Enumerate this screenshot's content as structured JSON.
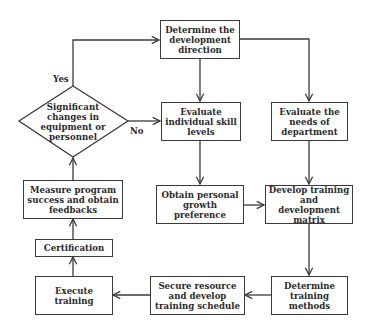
{
  "diagram": {
    "type": "flowchart",
    "colors": {
      "line": "#3a3a3a",
      "text": "#2a2a2a",
      "background": "#ffffff"
    },
    "nodes": {
      "determine_direction": "Determine the development direction",
      "evaluate_skills": "Evaluate individual skill levels",
      "evaluate_needs": "Evaluate the needs of department",
      "obtain_preference": "Obtain personal growth preference",
      "develop_matrix": "Develop training and development matrix",
      "determine_methods": "Determine training methods",
      "secure_resource": "Secure resource and develop training schedule",
      "execute_training": "Execute training",
      "certification": "Certification",
      "measure_success": "Measure program success and obtain feedbacks",
      "decision": "Significant changes in equipment or personnel"
    },
    "labels": {
      "yes": "Yes",
      "no": "No"
    },
    "edges": [
      [
        "determine_direction",
        "evaluate_skills"
      ],
      [
        "determine_direction",
        "evaluate_needs"
      ],
      [
        "evaluate_skills",
        "obtain_preference"
      ],
      [
        "evaluate_needs",
        "develop_matrix"
      ],
      [
        "obtain_preference",
        "develop_matrix"
      ],
      [
        "develop_matrix",
        "determine_methods"
      ],
      [
        "determine_methods",
        "secure_resource"
      ],
      [
        "secure_resource",
        "execute_training"
      ],
      [
        "execute_training",
        "certification"
      ],
      [
        "certification",
        "measure_success"
      ],
      [
        "measure_success",
        "decision"
      ],
      [
        "decision",
        "determine_direction",
        "Yes"
      ],
      [
        "decision",
        "evaluate_skills",
        "No"
      ]
    ]
  }
}
